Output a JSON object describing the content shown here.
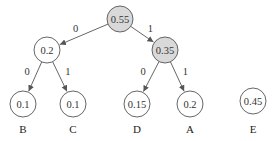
{
  "diagram": {
    "type": "huffman-tree",
    "colors": {
      "internal_fill": "#d9d9d9",
      "leaf_fill": "#ffffff",
      "stroke": "#555555"
    },
    "nodes": [
      {
        "id": "root",
        "value": "0.55",
        "x": 120,
        "y": 19,
        "shaded": true
      },
      {
        "id": "n02",
        "value": "0.2",
        "x": 47,
        "y": 50,
        "shaded": false
      },
      {
        "id": "n035",
        "value": "0.35",
        "x": 165,
        "y": 50,
        "shaded": true
      },
      {
        "id": "leafB",
        "value": "0.1",
        "x": 23,
        "y": 104,
        "shaded": false,
        "label": "B"
      },
      {
        "id": "leafC",
        "value": "0.1",
        "x": 73,
        "y": 104,
        "shaded": false,
        "label": "C"
      },
      {
        "id": "leafD",
        "value": "0.15",
        "x": 137,
        "y": 104,
        "shaded": false,
        "label": "D"
      },
      {
        "id": "leafA",
        "value": "0.2",
        "x": 190,
        "y": 104,
        "shaded": false,
        "label": "A"
      },
      {
        "id": "leafE",
        "value": "0.45",
        "x": 253,
        "y": 101,
        "shaded": false,
        "label": "E"
      }
    ],
    "edges": [
      {
        "from": "root",
        "to": "n02",
        "label": "0"
      },
      {
        "from": "root",
        "to": "n035",
        "label": "1"
      },
      {
        "from": "n02",
        "to": "leafB",
        "label": "0"
      },
      {
        "from": "n02",
        "to": "leafC",
        "label": "1"
      },
      {
        "from": "n035",
        "to": "leafD",
        "label": "0"
      },
      {
        "from": "n035",
        "to": "leafA",
        "label": "1"
      }
    ],
    "leaf_labels": [
      "B",
      "C",
      "D",
      "A",
      "E"
    ]
  }
}
